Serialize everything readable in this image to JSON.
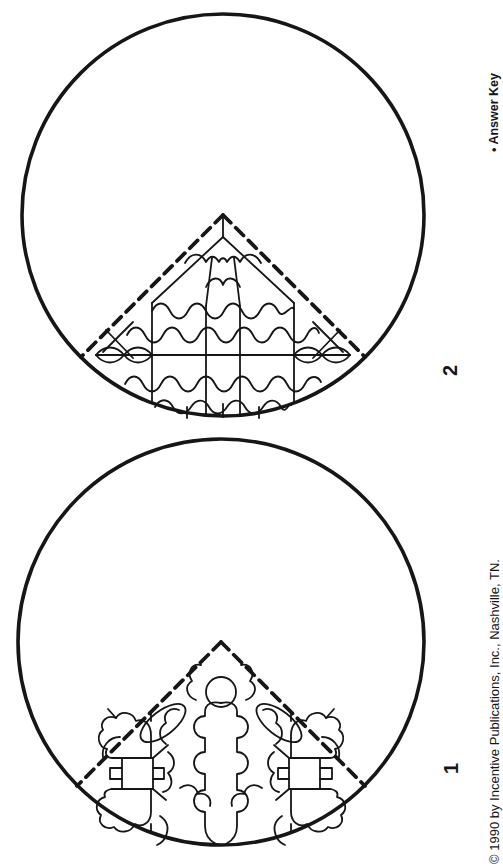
{
  "page": {
    "background": "#ffffff",
    "ink": "#161616"
  },
  "labels": {
    "answer_key": "• Answer Key",
    "copyright": "© 1990 by Incentive Publications, Inc., Nashville, TN."
  },
  "figures": [
    {
      "label": "2",
      "pattern": "circle with dashed quarter-wedge filled with wavy-line quilt grid"
    },
    {
      "label": "1",
      "pattern": "circle with dashed quarter-wedge filled with jigsaw-puzzle pieces"
    }
  ]
}
